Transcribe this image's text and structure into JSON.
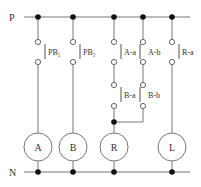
{
  "rails": {
    "top": "P",
    "bottom": "N"
  },
  "switches": [
    {
      "id": "pb1",
      "label": "PB₁"
    },
    {
      "id": "pb2",
      "label": "PB₂"
    },
    {
      "id": "aa",
      "label": "A-a"
    },
    {
      "id": "ab",
      "label": "A-b"
    },
    {
      "id": "ra",
      "label": "R-a"
    },
    {
      "id": "ba",
      "label": "B-a"
    },
    {
      "id": "bb",
      "label": "B-b"
    }
  ],
  "loads": [
    {
      "id": "A",
      "label": "A"
    },
    {
      "id": "B",
      "label": "B"
    },
    {
      "id": "R",
      "label": "R"
    },
    {
      "id": "L",
      "label": "L"
    }
  ],
  "colors": {
    "line": "#777777",
    "dot": "#111111",
    "text": "#333333"
  }
}
